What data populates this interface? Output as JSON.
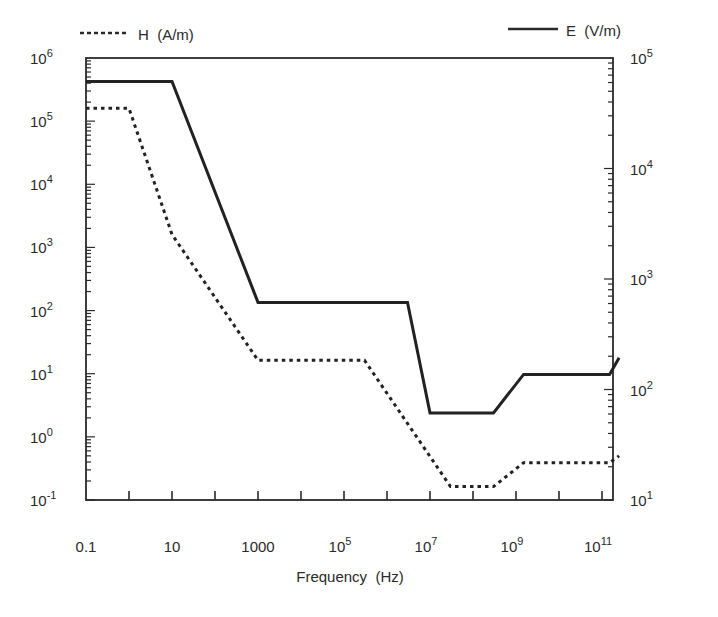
{
  "chart_data": {
    "type": "line",
    "title": "",
    "xlabel": "Frequency (Hz)",
    "ylabel_left": "H (A/m)",
    "ylabel_right": "E (V/m)",
    "x_scale": "log",
    "y_scale": "log",
    "xlim": [
      0.1,
      300000000000
    ],
    "ylim_left": [
      0.1,
      1000000
    ],
    "ylim_right": [
      10,
      100000
    ],
    "grid": false,
    "legend_position": "top",
    "x_tick_labels": [
      {
        "base": "0.1",
        "exp": "",
        "value": 0.1
      },
      {
        "base": "10",
        "exp": "",
        "value": 10
      },
      {
        "base": "1000",
        "exp": "",
        "value": 1000
      },
      {
        "base": "10",
        "exp": "5",
        "value": 100000
      },
      {
        "base": "10",
        "exp": "7",
        "value": 10000000
      },
      {
        "base": "10",
        "exp": "9",
        "value": 1000000000
      },
      {
        "base": "10",
        "exp": "11",
        "value": 100000000000
      }
    ],
    "y_left_tick_labels": [
      {
        "base": "10",
        "exp": "6"
      },
      {
        "base": "10",
        "exp": "5"
      },
      {
        "base": "10",
        "exp": "4"
      },
      {
        "base": "10",
        "exp": "3"
      },
      {
        "base": "10",
        "exp": "2"
      },
      {
        "base": "10",
        "exp": "1"
      },
      {
        "base": "10",
        "exp": "0"
      },
      {
        "base": "10",
        "exp": "-1"
      }
    ],
    "y_right_tick_labels": [
      {
        "base": "10",
        "exp": "5"
      },
      {
        "base": "10",
        "exp": "4"
      },
      {
        "base": "10",
        "exp": "3"
      },
      {
        "base": "10",
        "exp": "2"
      },
      {
        "base": "10",
        "exp": "1"
      }
    ],
    "series": [
      {
        "name": "H (A/m)",
        "axis": "left",
        "style": "dotted",
        "points": [
          [
            0.1,
            160000
          ],
          [
            1,
            160000
          ],
          [
            10,
            1600
          ],
          [
            1000,
            16.3
          ],
          [
            300000,
            16.3
          ],
          [
            30000000,
            0.163
          ],
          [
            300000000,
            0.163
          ],
          [
            1500000000,
            0.39
          ],
          [
            150000000000,
            0.39
          ],
          [
            250000000000,
            0.5
          ]
        ]
      },
      {
        "name": "E (V/m)",
        "axis": "right",
        "style": "solid",
        "points": [
          [
            0.1,
            61400
          ],
          [
            10,
            61400
          ],
          [
            1000,
            614
          ],
          [
            3000000,
            614
          ],
          [
            10000000,
            61.4
          ],
          [
            300000000,
            61.4
          ],
          [
            1500000000,
            137
          ],
          [
            150000000000,
            137
          ],
          [
            250000000000,
            194
          ]
        ]
      }
    ]
  },
  "legend": {
    "h_label": "H  (A/m)",
    "e_label": "E  (V/m)"
  },
  "axes": {
    "x_title": "Frequency  (Hz)"
  }
}
